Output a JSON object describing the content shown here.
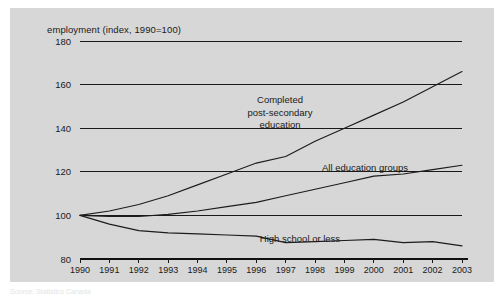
{
  "figure": {
    "background_color": "#ffffff",
    "panel_color": "#d7d7d7",
    "line_color": "#1c1c1c"
  },
  "source_note": "Source: Statistics Canada",
  "chart_data": {
    "type": "line",
    "title": "",
    "axis_title": "employment (index, 1990=100)",
    "xlabel": "",
    "ylabel": "employment (index, 1990=100)",
    "grid": true,
    "legend_position": "inline-annotations",
    "xlim": [
      1990,
      2003
    ],
    "ylim": [
      80,
      180
    ],
    "yticks": [
      80,
      100,
      120,
      140,
      160,
      180
    ],
    "ytick_labels": [
      "80",
      "100",
      "120",
      "140",
      "160",
      "180"
    ],
    "x": [
      1990,
      1991,
      1992,
      1993,
      1994,
      1995,
      1996,
      1997,
      1998,
      1999,
      2000,
      2001,
      2002,
      2003
    ],
    "xtick_labels": [
      "1990",
      "1991",
      "1992",
      "1993",
      "1994",
      "1995",
      "1996",
      "1997",
      "1998",
      "1999",
      "2000",
      "2001",
      "2002",
      "2003"
    ],
    "series": [
      {
        "name": "Completed post-secondary education",
        "label": "Completed\npost-secondary\neducation",
        "label_lines": [
          "Completed",
          "post-secondary",
          "education"
        ],
        "values": [
          100,
          102,
          105,
          109,
          114,
          119,
          124,
          127,
          134,
          140,
          146,
          152,
          159,
          166
        ]
      },
      {
        "name": "All education groups",
        "label": "All education groups",
        "label_lines": [
          "All education groups"
        ],
        "values": [
          100,
          99.5,
          99.5,
          100.5,
          102,
          104,
          106,
          109,
          112,
          115,
          118,
          119,
          121,
          123
        ]
      },
      {
        "name": "High school or less",
        "label": "High school or less",
        "label_lines": [
          "High school or less"
        ],
        "values": [
          100,
          96,
          93,
          92,
          91.5,
          91,
          90.5,
          87.5,
          88,
          88.5,
          89,
          87.5,
          88,
          86
        ]
      }
    ],
    "annotations": [
      {
        "text_lines": [
          "Completed",
          "post-secondary",
          "education"
        ],
        "series": "Completed post-secondary education"
      },
      {
        "text_lines": [
          "All education groups"
        ],
        "series": "All education groups"
      },
      {
        "text_lines": [
          "High school or less"
        ],
        "series": "High school or less"
      }
    ]
  }
}
